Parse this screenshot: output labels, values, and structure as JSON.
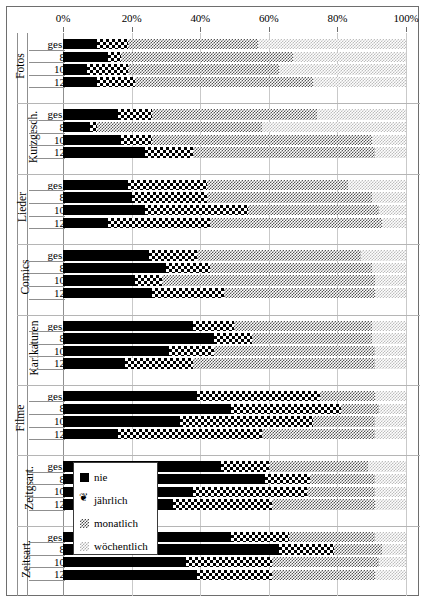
{
  "chart_data": {
    "type": "bar",
    "subtype": "stacked-horizontal-100-percent",
    "title": "",
    "xlabel": "",
    "ylabel": "",
    "xlim": [
      0,
      100
    ],
    "x_ticks": [
      0,
      20,
      40,
      60,
      80,
      100
    ],
    "x_tick_labels": [
      "0%",
      "20%",
      "40%",
      "60%",
      "80%",
      "100%"
    ],
    "grid": true,
    "legend_position": "inside-left-lower",
    "series": [
      {
        "name": "nie",
        "pattern": "solid-black"
      },
      {
        "name": "jährlich",
        "pattern": "checkerboard"
      },
      {
        "name": "monatlich",
        "pattern": "medium-dither"
      },
      {
        "name": "wöchentlich",
        "pattern": "light-dither"
      }
    ],
    "row_labels": [
      "ges.",
      "8",
      "10",
      "12"
    ],
    "groups": [
      {
        "category": "Fotos",
        "rows": [
          {
            "label": "ges.",
            "values": [
              10,
              9,
              38,
              43
            ]
          },
          {
            "label": "8",
            "values": [
              13,
              4,
              50,
              33
            ]
          },
          {
            "label": "10",
            "values": [
              7,
              12,
              44,
              37
            ]
          },
          {
            "label": "12",
            "values": [
              10,
              11,
              52,
              27
            ]
          }
        ]
      },
      {
        "category": "Kurzgesch.",
        "rows": [
          {
            "label": "ges.",
            "values": [
              16,
              10,
              48,
              26
            ]
          },
          {
            "label": "8",
            "values": [
              8,
              2,
              48,
              42
            ]
          },
          {
            "label": "10",
            "values": [
              17,
              9,
              64,
              10
            ]
          },
          {
            "label": "12",
            "values": [
              24,
              14,
              53,
              9
            ]
          }
        ]
      },
      {
        "category": "Lieder",
        "rows": [
          {
            "label": "ges.",
            "values": [
              19,
              23,
              41,
              17
            ]
          },
          {
            "label": "8",
            "values": [
              20,
              22,
              48,
              10
            ]
          },
          {
            "label": "10",
            "values": [
              24,
              30,
              38,
              8
            ]
          },
          {
            "label": "12",
            "values": [
              13,
              30,
              50,
              7
            ]
          }
        ]
      },
      {
        "category": "Comics",
        "rows": [
          {
            "label": "ges.",
            "values": [
              25,
              14,
              48,
              13
            ]
          },
          {
            "label": "8",
            "values": [
              30,
              13,
              47,
              10
            ]
          },
          {
            "label": "10",
            "values": [
              21,
              8,
              62,
              9
            ]
          },
          {
            "label": "12",
            "values": [
              26,
              21,
              44,
              9
            ]
          }
        ]
      },
      {
        "category": "Karikaturen",
        "rows": [
          {
            "label": "ges.",
            "values": [
              38,
              12,
              40,
              10
            ]
          },
          {
            "label": "8",
            "values": [
              44,
              11,
              35,
              10
            ]
          },
          {
            "label": "10",
            "values": [
              31,
              13,
              47,
              9
            ]
          },
          {
            "label": "12",
            "values": [
              18,
              20,
              53,
              9
            ]
          }
        ]
      },
      {
        "category": "Filme",
        "rows": [
          {
            "label": "ges.",
            "values": [
              39,
              36,
              16,
              9
            ]
          },
          {
            "label": "8",
            "values": [
              49,
              32,
              11,
              8
            ]
          },
          {
            "label": "10",
            "values": [
              34,
              39,
              18,
              9
            ]
          },
          {
            "label": "12",
            "values": [
              16,
              42,
              33,
              9
            ]
          }
        ]
      },
      {
        "category": "Zeitgsart.",
        "rows": [
          {
            "label": "ges.",
            "values": [
              46,
              14,
              29,
              11
            ]
          },
          {
            "label": "8",
            "values": [
              59,
              13,
              19,
              9
            ]
          },
          {
            "label": "10",
            "values": [
              38,
              33,
              20,
              9
            ]
          },
          {
            "label": "12",
            "values": [
              32,
              29,
              30,
              9
            ]
          }
        ]
      },
      {
        "category": "Zeitsart.",
        "rows": [
          {
            "label": "ges.",
            "values": [
              49,
              17,
              25,
              9
            ]
          },
          {
            "label": "8",
            "values": [
              63,
              16,
              14,
              7
            ]
          },
          {
            "label": "10",
            "values": [
              36,
              25,
              31,
              8
            ]
          },
          {
            "label": "12",
            "values": [
              39,
              22,
              30,
              9
            ]
          }
        ]
      }
    ]
  },
  "legend": {
    "items": [
      {
        "label": "nie",
        "key": "nie"
      },
      {
        "label": "jährlich",
        "key": "jaehrlich"
      },
      {
        "label": "monatlich",
        "key": "monatlich"
      },
      {
        "label": "wöchentlich",
        "key": "woechentlich"
      }
    ]
  }
}
